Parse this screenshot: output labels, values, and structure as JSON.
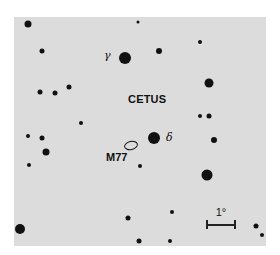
{
  "map": {
    "constellation": "CETUS",
    "labels": {
      "gamma": "γ",
      "delta": "δ",
      "object": "M77"
    },
    "scale_bar": "1°",
    "colors": {
      "background": "#dcdcdc",
      "ink": "#111111"
    },
    "stars": [
      {
        "x": 28,
        "y": 24,
        "r": 3.5
      },
      {
        "x": 138,
        "y": 22,
        "r": 1.5
      },
      {
        "x": 42,
        "y": 51,
        "r": 2.5
      },
      {
        "x": 125,
        "y": 58,
        "r": 6,
        "name": "gamma"
      },
      {
        "x": 159,
        "y": 51,
        "r": 3
      },
      {
        "x": 200,
        "y": 42,
        "r": 2
      },
      {
        "x": 209,
        "y": 83,
        "r": 4.5
      },
      {
        "x": 40,
        "y": 92,
        "r": 2.5
      },
      {
        "x": 55,
        "y": 93,
        "r": 2.5
      },
      {
        "x": 69,
        "y": 87,
        "r": 2.5
      },
      {
        "x": 81,
        "y": 123,
        "r": 2
      },
      {
        "x": 200,
        "y": 116,
        "r": 2
      },
      {
        "x": 209,
        "y": 116,
        "r": 2.5
      },
      {
        "x": 214,
        "y": 140,
        "r": 3
      },
      {
        "x": 28,
        "y": 136,
        "r": 2
      },
      {
        "x": 42,
        "y": 138,
        "r": 2.5
      },
      {
        "x": 46,
        "y": 152,
        "r": 3.5
      },
      {
        "x": 29,
        "y": 165,
        "r": 2
      },
      {
        "x": 154,
        "y": 138,
        "r": 6,
        "name": "delta"
      },
      {
        "x": 140,
        "y": 166,
        "r": 2
      },
      {
        "x": 207,
        "y": 175,
        "r": 5.5
      },
      {
        "x": 20,
        "y": 229,
        "r": 5
      },
      {
        "x": 128,
        "y": 218,
        "r": 2.5
      },
      {
        "x": 172,
        "y": 212,
        "r": 2
      },
      {
        "x": 139,
        "y": 241,
        "r": 2.5
      },
      {
        "x": 170,
        "y": 241,
        "r": 2
      },
      {
        "x": 256,
        "y": 226,
        "r": 2.5
      },
      {
        "x": 262,
        "y": 235,
        "r": 2
      }
    ]
  }
}
